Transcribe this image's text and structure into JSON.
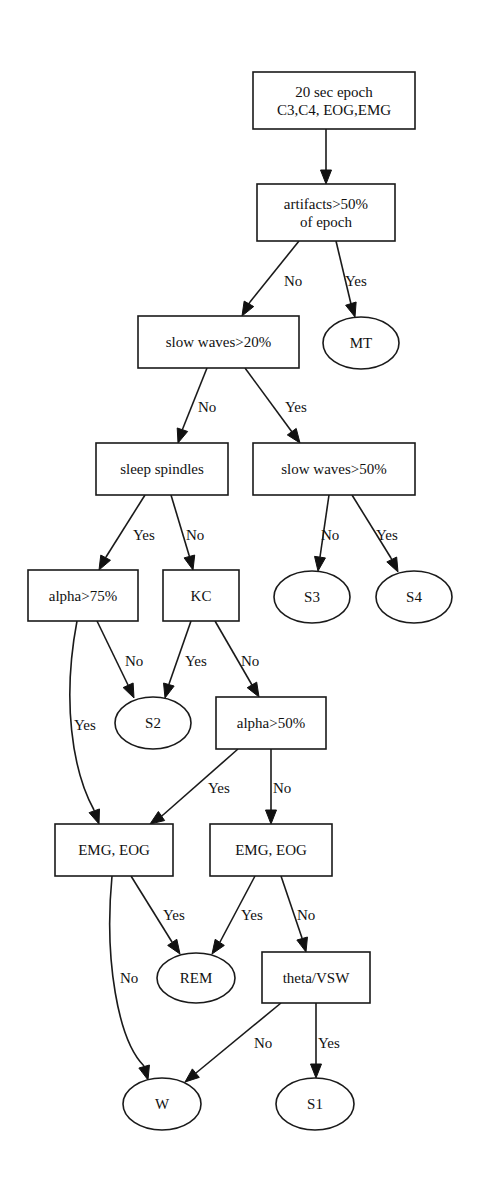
{
  "diagram": {
    "type": "decision-tree",
    "nodes": [
      {
        "id": "epoch",
        "shape": "box",
        "lines": [
          "20 sec epoch",
          "C3,C4, EOG,EMG"
        ],
        "x": 253,
        "y": 72,
        "w": 162,
        "h": 57
      },
      {
        "id": "artifacts",
        "shape": "box",
        "lines": [
          "artifacts>50%",
          "of epoch"
        ],
        "x": 257,
        "y": 184,
        "w": 138,
        "h": 57
      },
      {
        "id": "sw20",
        "shape": "box",
        "lines": [
          "slow waves>20%"
        ],
        "x": 138,
        "y": 316,
        "w": 161,
        "h": 52
      },
      {
        "id": "MT",
        "shape": "ellipse",
        "lines": [
          "MT"
        ],
        "cx": 361,
        "cy": 343,
        "rx": 38,
        "ry": 26
      },
      {
        "id": "spindles",
        "shape": "box",
        "lines": [
          "sleep spindles"
        ],
        "x": 96,
        "y": 443,
        "w": 132,
        "h": 52
      },
      {
        "id": "sw50",
        "shape": "box",
        "lines": [
          "slow waves>50%"
        ],
        "x": 253,
        "y": 443,
        "w": 162,
        "h": 52
      },
      {
        "id": "alpha75",
        "shape": "box",
        "lines": [
          "alpha>75%"
        ],
        "x": 28,
        "y": 570,
        "w": 110,
        "h": 51
      },
      {
        "id": "KC",
        "shape": "box",
        "lines": [
          "KC"
        ],
        "x": 163,
        "y": 570,
        "w": 76,
        "h": 51
      },
      {
        "id": "S3",
        "shape": "ellipse",
        "lines": [
          "S3"
        ],
        "cx": 312,
        "cy": 597,
        "rx": 38,
        "ry": 26
      },
      {
        "id": "S4",
        "shape": "ellipse",
        "lines": [
          "S4"
        ],
        "cx": 414,
        "cy": 597,
        "rx": 38,
        "ry": 26
      },
      {
        "id": "S2",
        "shape": "ellipse",
        "lines": [
          "S2"
        ],
        "cx": 153,
        "cy": 723,
        "rx": 38,
        "ry": 26
      },
      {
        "id": "alpha50",
        "shape": "box",
        "lines": [
          "alpha>50%"
        ],
        "x": 216,
        "y": 697,
        "w": 110,
        "h": 52
      },
      {
        "id": "emgL",
        "shape": "box",
        "lines": [
          "EMG, EOG"
        ],
        "x": 55,
        "y": 824,
        "w": 118,
        "h": 52
      },
      {
        "id": "emgR",
        "shape": "box",
        "lines": [
          "EMG, EOG"
        ],
        "x": 210,
        "y": 824,
        "w": 122,
        "h": 52
      },
      {
        "id": "REM",
        "shape": "ellipse",
        "lines": [
          "REM"
        ],
        "cx": 196,
        "cy": 978,
        "rx": 39,
        "ry": 25
      },
      {
        "id": "theta",
        "shape": "box",
        "lines": [
          "theta/VSW"
        ],
        "x": 262,
        "y": 952,
        "w": 108,
        "h": 51
      },
      {
        "id": "W",
        "shape": "ellipse",
        "lines": [
          "W"
        ],
        "cx": 162,
        "cy": 1104,
        "rx": 39,
        "ry": 26
      },
      {
        "id": "S1",
        "shape": "ellipse",
        "lines": [
          "S1"
        ],
        "cx": 315,
        "cy": 1104,
        "rx": 39,
        "ry": 26
      }
    ],
    "edges": [
      {
        "from": "epoch",
        "to": "artifacts",
        "label": "",
        "path": "M326,129 L326,170",
        "tip": [
          326,
          184
        ],
        "lx": 0,
        "ly": 0
      },
      {
        "from": "artifacts",
        "to": "sw20",
        "label": "No",
        "path": "M299,241 L250,302",
        "tip": [
          242,
          316
        ],
        "lx": 284,
        "ly": 286
      },
      {
        "from": "artifacts",
        "to": "MT",
        "label": "Yes",
        "path": "M336,241 L351,304",
        "tip": [
          355,
          317
        ],
        "lx": 345,
        "ly": 286
      },
      {
        "from": "sw20",
        "to": "spindles",
        "label": "No",
        "path": "M207,368 L183,428",
        "tip": [
          178,
          443
        ],
        "lx": 198,
        "ly": 412
      },
      {
        "from": "sw20",
        "to": "sw50",
        "label": "Yes",
        "path": "M245,368 L292,432",
        "tip": [
          300,
          443
        ],
        "lx": 285,
        "ly": 412
      },
      {
        "from": "spindles",
        "to": "alpha75",
        "label": "Yes",
        "path": "M145,495 L106,557",
        "tip": [
          99,
          570
        ],
        "lx": 133,
        "ly": 540
      },
      {
        "from": "spindles",
        "to": "KC",
        "label": "No",
        "path": "M171,495 L189,555",
        "tip": [
          193,
          570
        ],
        "lx": 186,
        "ly": 540
      },
      {
        "from": "sw50",
        "to": "S3",
        "label": "No",
        "path": "M329,495 L320,557",
        "tip": [
          318,
          571
        ],
        "lx": 321,
        "ly": 540
      },
      {
        "from": "sw50",
        "to": "S4",
        "label": "Yes",
        "path": "M352,495 L391,558",
        "tip": [
          398,
          572
        ],
        "lx": 376,
        "ly": 540
      },
      {
        "from": "alpha75",
        "to": "S2",
        "label": "No",
        "path": "M97,621 L128,685",
        "tip": [
          134,
          698
        ],
        "lx": 125,
        "ly": 666
      },
      {
        "from": "KC",
        "to": "S2",
        "label": "Yes",
        "path": "M191,621 L169,684",
        "tip": [
          165,
          698
        ],
        "lx": 185,
        "ly": 666
      },
      {
        "from": "KC",
        "to": "alpha50",
        "label": "No",
        "path": "M215,621 L252,685",
        "tip": [
          259,
          697
        ],
        "lx": 241,
        "ly": 666
      },
      {
        "from": "alpha75",
        "to": "emgL",
        "label": "Yes",
        "path": "M77,621 C62,700 72,770 94,810",
        "tip": [
          99,
          824
        ],
        "lx": 74,
        "ly": 730
      },
      {
        "from": "alpha50",
        "to": "emgR",
        "label": "No",
        "path": "M271,749 L271,809",
        "tip": [
          271,
          824
        ],
        "lx": 273,
        "ly": 793
      },
      {
        "from": "alpha50",
        "to": "emgL",
        "label": "Yes",
        "path": "M238,749 L163,815",
        "tip": [
          150,
          824
        ],
        "lx": 208,
        "ly": 793
      },
      {
        "from": "emgL",
        "to": "REM",
        "label": "Yes",
        "path": "M131,876 L172,942",
        "tip": [
          180,
          954
        ],
        "lx": 163,
        "ly": 920
      },
      {
        "from": "emgR",
        "to": "REM",
        "label": "Yes",
        "path": "M255,876 L220,942",
        "tip": [
          212,
          954
        ],
        "lx": 241,
        "ly": 920
      },
      {
        "from": "emgR",
        "to": "theta",
        "label": "No",
        "path": "M281,876 L302,938",
        "tip": [
          306,
          952
        ],
        "lx": 297,
        "ly": 920
      },
      {
        "from": "emgL",
        "to": "W",
        "label": "No",
        "path": "M112,876 C104,960 118,1040 144,1066",
        "tip": [
          148,
          1080
        ],
        "lx": 120,
        "ly": 983
      },
      {
        "from": "theta",
        "to": "W",
        "label": "No",
        "path": "M281,1003 L196,1073",
        "tip": [
          185,
          1082
        ],
        "lx": 254,
        "ly": 1048
      },
      {
        "from": "theta",
        "to": "S1",
        "label": "Yes",
        "path": "M316,1003 L316,1064",
        "tip": [
          316,
          1078
        ],
        "lx": 318,
        "ly": 1048
      }
    ]
  },
  "labels": {
    "epoch_l1": "20 sec epoch",
    "epoch_l2": "C3,C4, EOG,EMG",
    "artifacts_l1": "artifacts>50%",
    "artifacts_l2": "of epoch",
    "sw20": "slow waves>20%",
    "MT": "MT",
    "spindles": "sleep spindles",
    "sw50": "slow waves>50%",
    "alpha75": "alpha>75%",
    "KC": "KC",
    "S3": "S3",
    "S4": "S4",
    "S2": "S2",
    "alpha50": "alpha>50%",
    "emgL": "EMG, EOG",
    "emgR": "EMG, EOG",
    "REM": "REM",
    "theta": "theta/VSW",
    "W": "W",
    "S1": "S1",
    "yes": "Yes",
    "no": "No"
  }
}
